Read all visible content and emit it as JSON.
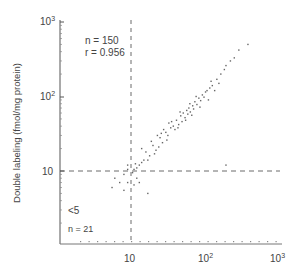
{
  "chart_data": {
    "type": "scatter",
    "title": "",
    "xlabel": "",
    "ylabel": "Double labeling (fmol/mg protein)",
    "xscale": "log",
    "yscale": "log",
    "xlim": [
      1.5,
      1000
    ],
    "ylim": [
      1.5,
      1000
    ],
    "x_ticks": [
      "10",
      "10²",
      "10³"
    ],
    "y_ticks": [
      "10",
      "10²",
      "10³"
    ],
    "grid": false,
    "reference_lines": [
      {
        "axis": "x",
        "value": 10,
        "style": "dashed"
      },
      {
        "axis": "y",
        "value": 10,
        "style": "dashed"
      }
    ],
    "annotations": [
      {
        "text": "n  =  150",
        "position": "top-left"
      },
      {
        "text": "r  =  0.956",
        "position": "top-left"
      },
      {
        "text": "<5",
        "position": "bottom-left"
      },
      {
        "text": "n = 21",
        "position": "bottom-left"
      }
    ],
    "series": [
      {
        "name": "samples",
        "points": [
          [
            12,
            11
          ],
          [
            13,
            12
          ],
          [
            14,
            13
          ],
          [
            11,
            10.5
          ],
          [
            15,
            14
          ],
          [
            16,
            18
          ],
          [
            18,
            16
          ],
          [
            20,
            22
          ],
          [
            22,
            19
          ],
          [
            19,
            25
          ],
          [
            24,
            21
          ],
          [
            25,
            28
          ],
          [
            27,
            24
          ],
          [
            30,
            33
          ],
          [
            28,
            36
          ],
          [
            32,
            30
          ],
          [
            35,
            38
          ],
          [
            33,
            44
          ],
          [
            38,
            40
          ],
          [
            40,
            36
          ],
          [
            42,
            48
          ],
          [
            45,
            42
          ],
          [
            48,
            55
          ],
          [
            50,
            46
          ],
          [
            52,
            60
          ],
          [
            55,
            52
          ],
          [
            58,
            65
          ],
          [
            60,
            58
          ],
          [
            62,
            70
          ],
          [
            65,
            62
          ],
          [
            70,
            75
          ],
          [
            72,
            68
          ],
          [
            75,
            85
          ],
          [
            80,
            78
          ],
          [
            85,
            95
          ],
          [
            90,
            88
          ],
          [
            95,
            105
          ],
          [
            100,
            98
          ],
          [
            110,
            120
          ],
          [
            120,
            130
          ],
          [
            130,
            140
          ],
          [
            150,
            170
          ],
          [
            170,
            200
          ],
          [
            200,
            260
          ],
          [
            230,
            300
          ],
          [
            260,
            330
          ],
          [
            300,
            420
          ],
          [
            400,
            500
          ],
          [
            14,
            20
          ],
          [
            17,
            14
          ],
          [
            21,
            17
          ],
          [
            23,
            30
          ],
          [
            26,
            32
          ],
          [
            31,
            26
          ],
          [
            36,
            46
          ],
          [
            44,
            38
          ],
          [
            47,
            62
          ],
          [
            56,
            48
          ],
          [
            64,
            80
          ],
          [
            68,
            56
          ],
          [
            78,
            100
          ],
          [
            88,
            72
          ],
          [
            105,
            115
          ],
          [
            115,
            90
          ],
          [
            125,
            160
          ],
          [
            140,
            120
          ],
          [
            160,
            150
          ],
          [
            190,
            230
          ],
          [
            6,
            8
          ],
          [
            7,
            7
          ],
          [
            8,
            9
          ],
          [
            9,
            12
          ],
          [
            9,
            7
          ],
          [
            8,
            5.5
          ],
          [
            5.5,
            6
          ],
          [
            11,
            6.5
          ],
          [
            12,
            8
          ],
          [
            13,
            7
          ],
          [
            17,
            5
          ],
          [
            200,
            12
          ],
          [
            9,
            10.5
          ],
          [
            10.5,
            9.5
          ],
          [
            11.5,
            12.5
          ]
        ]
      }
    ]
  }
}
